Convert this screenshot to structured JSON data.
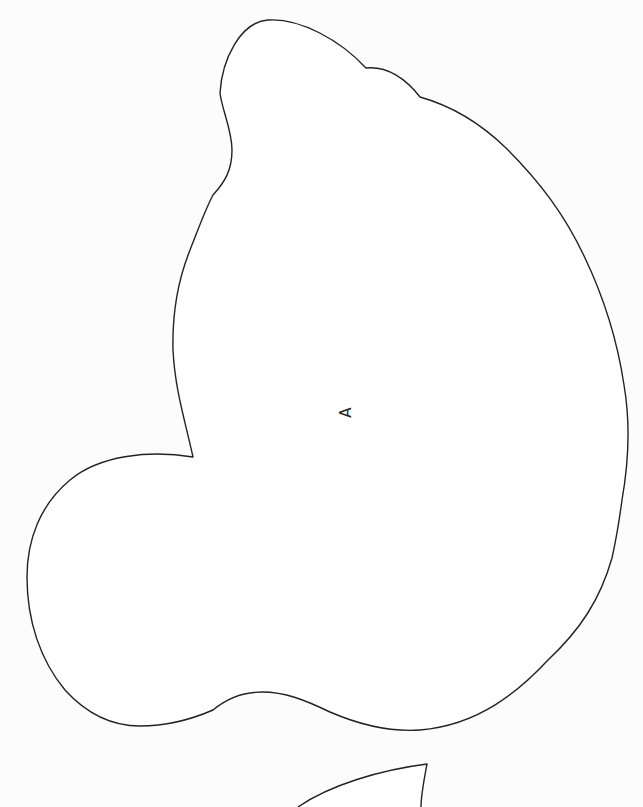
{
  "diagram": {
    "background": "#fcfcfc",
    "stroke_color": "#222222",
    "fill_color": "#ffffff",
    "regions": [
      {
        "id": "region-a",
        "label": "A",
        "label_rotation_deg": -90,
        "label_position": {
          "x": 347,
          "y": 412
        }
      },
      {
        "id": "region-bottom-partial",
        "label": ""
      }
    ]
  }
}
